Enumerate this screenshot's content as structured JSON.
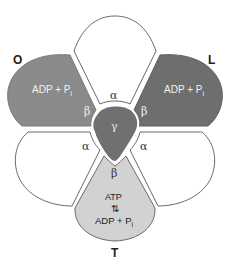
{
  "diagram": {
    "title_labels": {
      "O": "O",
      "L": "L",
      "T": "T"
    },
    "subunits": {
      "top_alpha": {
        "label": "α",
        "fill": "#ffffff"
      },
      "left_beta_O": {
        "label": "β",
        "content": "ADP + P",
        "subscript": "i",
        "fill": "#8a8a8a",
        "text_color": "#f2f2f2"
      },
      "right_beta_L": {
        "label": "β",
        "content": "ADP + P",
        "subscript": "i",
        "fill": "#6e6e6e",
        "text_color": "#f2f2f2"
      },
      "lower_left_alpha": {
        "label": "α",
        "fill": "#ffffff"
      },
      "lower_right_alpha": {
        "label": "α",
        "fill": "#ffffff"
      },
      "bottom_beta_T": {
        "label": "β",
        "line1": "ATP",
        "arrows": "⇅",
        "line3": "ADP + P",
        "subscript": "i",
        "fill": "#d2d2d2",
        "text_color": "#222222"
      },
      "center_gamma": {
        "label": "γ",
        "fill": "#707070",
        "text_color": "#e8e8e8"
      }
    },
    "colors": {
      "outline": "#6a6a6a",
      "label_dark": "#222222"
    }
  }
}
